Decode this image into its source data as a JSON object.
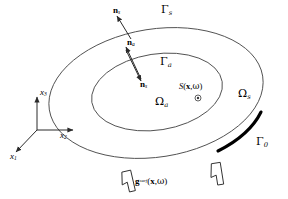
{
  "figure": {
    "kind": "domain-schematic",
    "background": "#ffffff",
    "line_color": "#3a3a3a",
    "thick_boundary_color": "#000000",
    "text_color": "#000000"
  },
  "boundaries": {
    "outer_surface": {
      "label": "Γ",
      "sub": "s",
      "name": "outer boundary gamma-s"
    },
    "inner_surface": {
      "label": "Γ",
      "sub": "a",
      "name": "inner boundary gamma-a"
    },
    "loaded_surface": {
      "label": "Γ",
      "sub": "0",
      "name": "loaded boundary gamma-zero"
    }
  },
  "regions": {
    "outer_domain": {
      "label": "Ω",
      "sub": "s",
      "name": "outer domain omega-s"
    },
    "inner_domain": {
      "label": "Ω",
      "sub": "a",
      "name": "inner domain omega-a"
    }
  },
  "normals": {
    "outer_normal": {
      "symbol": "n",
      "sub": "s",
      "name": "outer surface normal"
    },
    "interface_normal_a": {
      "symbol": "n",
      "sub": "a",
      "name": "interface normal a"
    },
    "interface_normal_s": {
      "symbol": "n",
      "sub": "s",
      "name": "interface normal s"
    }
  },
  "source": {
    "symbol": "S",
    "arg_open": "(",
    "arg_vector": "x",
    "arg_sep": ",",
    "arg_omega": "ω",
    "arg_close": ")",
    "marker": "◎",
    "name": "acoustic source point"
  },
  "load": {
    "symbol": "g",
    "superscript": "surf",
    "arg_open": "(",
    "arg_vector": "x",
    "arg_sep": ",",
    "arg_omega": "ω",
    "arg_close": ")",
    "name": "prescribed surface load"
  },
  "axes": {
    "x1": {
      "symbol": "x",
      "sub": "1"
    },
    "x2": {
      "symbol": "x",
      "sub": "2"
    },
    "x3": {
      "symbol": "x",
      "sub": "3"
    }
  }
}
